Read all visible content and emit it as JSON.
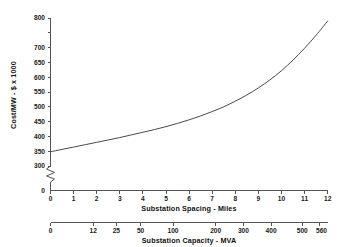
{
  "chart_data": {
    "type": "line",
    "title": "",
    "xlabel": "Substation Spacing - Miles",
    "ylabel": "Cost/MW - $ x 1000",
    "secondary_xlabel": "Substation Capacity - MVA",
    "grid": false,
    "legend": "none",
    "xlim": [
      0,
      12
    ],
    "ylim": [
      300,
      800
    ],
    "y_axis_break": true,
    "y_axis_break_symbol": "zigzag",
    "y_axis_origin_label": "0",
    "x_tick_labels": [
      "0",
      "1",
      "2",
      "3",
      "4",
      "5",
      "6",
      "7",
      "8",
      "9",
      "10",
      "11",
      "12"
    ],
    "x_tick_values": [
      0,
      1,
      2,
      3,
      4,
      5,
      6,
      7,
      8,
      9,
      10,
      11,
      12
    ],
    "y_tick_labels": [
      "800",
      "700",
      "650",
      "600",
      "550",
      "500",
      "450",
      "400",
      "350",
      "300"
    ],
    "y_tick_values": [
      800,
      700,
      650,
      600,
      550,
      500,
      450,
      400,
      350,
      300
    ],
    "y_unlabeled_tick_values": [
      750
    ],
    "secondary_x_tick_labels": [
      "0",
      "12",
      "25",
      "50",
      "100",
      "200",
      "300",
      "400",
      "500",
      "560"
    ],
    "secondary_x_tick_values": [
      0,
      12,
      25,
      50,
      100,
      200,
      300,
      400,
      500,
      560
    ],
    "secondary_x_tick_positions_miles": [
      0,
      1.85,
      2.85,
      3.9,
      5.3,
      7.15,
      8.35,
      9.55,
      10.9,
      11.65
    ],
    "x": [
      0,
      0.5,
      1,
      1.5,
      2,
      2.5,
      3,
      3.5,
      4,
      4.5,
      5,
      5.5,
      6,
      6.5,
      7,
      7.5,
      8,
      8.5,
      9,
      9.5,
      10,
      10.5,
      11,
      11.5,
      12
    ],
    "values": [
      348,
      356,
      364,
      372,
      380,
      388,
      396,
      405,
      414,
      423,
      433,
      444,
      456,
      469,
      484,
      500,
      519,
      540,
      564,
      591,
      622,
      658,
      698,
      742,
      790
    ],
    "series": [
      {
        "name": "Cost/MW",
        "values": [
          348,
          356,
          364,
          372,
          380,
          388,
          396,
          405,
          414,
          423,
          433,
          444,
          456,
          469,
          484,
          500,
          519,
          540,
          564,
          591,
          622,
          658,
          698,
          742,
          790
        ]
      }
    ]
  }
}
